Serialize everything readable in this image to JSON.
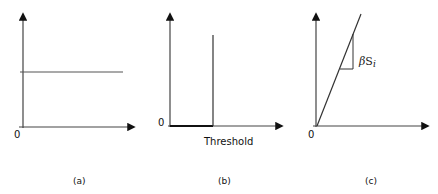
{
  "figure": {
    "panels": [
      {
        "id": "a",
        "caption": "(a)",
        "origin_label": "0",
        "curve": "constant horizontal line"
      },
      {
        "id": "b",
        "caption": "(b)",
        "origin_label": "0",
        "x_label": "Threshold",
        "curve": "step / impulse at threshold"
      },
      {
        "id": "c",
        "caption": "(c)",
        "origin_label": "0",
        "slope_label_greek": "β",
        "slope_label_var": "S",
        "slope_label_sub": "i",
        "curve": "linear through origin with slope triangle"
      }
    ],
    "colors": {
      "axis": "#111111",
      "line": "#333333"
    }
  }
}
